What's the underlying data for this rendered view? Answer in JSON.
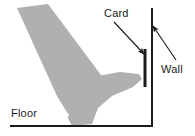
{
  "figure": {
    "type": "line-drawing",
    "title": "",
    "background_color": "#ffffff",
    "ink_color": "#1a1a1a",
    "shape_fill_color": "#b0b0b0"
  },
  "labels": {
    "card": "Card",
    "wall": "Wall",
    "floor": "Floor"
  },
  "annotations": [
    {
      "name": "card-leader-arrow",
      "label": "Card",
      "from": [
        114,
        22
      ],
      "to": [
        144,
        54
      ],
      "direction": "down-right"
    },
    {
      "name": "wall-leader-arrow",
      "label": "Wall",
      "from": [
        176,
        60
      ],
      "to": [
        153,
        26
      ],
      "direction": "up-left"
    }
  ],
  "elements": {
    "wall": {
      "name": "wall",
      "orientation": "vertical",
      "x": 152,
      "y_top": 8,
      "y_bottom": 127,
      "thickness": 2
    },
    "card": {
      "name": "card",
      "orientation": "vertical",
      "x": 145,
      "y_top": 49,
      "y_bottom": 87,
      "thickness": 3
    },
    "floor": {
      "name": "floor",
      "orientation": "horizontal",
      "y": 126,
      "x_left": 10,
      "x_right": 153,
      "thickness": 2
    },
    "shin": {
      "name": "shin-shape",
      "points": "17,8 48,4 104,79 93,90 68,114 57,96"
    },
    "foot": {
      "name": "foot-shape",
      "points": "73,95 97,76 120,72 139,74 142,79 133,87 112,96 98,108 92,124 72,126 68,118"
    }
  }
}
